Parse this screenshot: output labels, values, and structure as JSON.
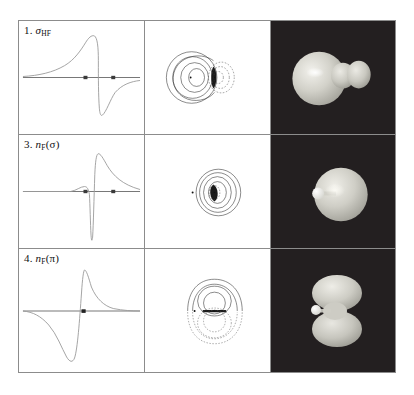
{
  "figure": {
    "caption_present": false,
    "columns": [
      "radial-profile-plot",
      "contour-plot",
      "3d-isosurface-render"
    ],
    "rows": 3,
    "background_color": "#ffffff",
    "border_color": "#8c8c8c",
    "render_background": "#231f20"
  },
  "panels": [
    {
      "index": "1.",
      "label_prefix": "1.",
      "label_main": "σ",
      "label_sub": "HF",
      "label_full": "1. σHF",
      "orbital_type": "sigma bonding",
      "plot": {
        "type": "line",
        "description": "radial amplitude profile along internuclear axis, rises to positive maximum then drops through node to deep negative minimum and recovers",
        "nuclei_markers": 2,
        "marker_positions_frac": [
          0.39,
          0.62
        ],
        "axis_zero_frac": 0.5
      },
      "contour": {
        "lobes_solid": "large nested ovals on left centered on heavy nucleus",
        "lobes_dashed": "small nested arcs on right",
        "nucleus_dots": 2
      },
      "render": {
        "shapes": "large sphere left fused with smaller sphere right",
        "atom_highlight": "bright spot at left-of-center"
      }
    },
    {
      "index": "3.",
      "label_prefix": "3.",
      "label_main": "n",
      "label_sub": "F",
      "label_paren": "(σ)",
      "label_full": "3. nF(σ)",
      "orbital_type": "fluorine sigma lone pair",
      "plot": {
        "type": "line",
        "description": "flat then small positive bump, sharp negative spike at node, then tall positive peak with long decaying tail",
        "nuclei_markers": 2,
        "marker_positions_frac": [
          0.39,
          0.62
        ],
        "axis_zero_frac": 0.5
      },
      "contour": {
        "lobes_solid": "concentric rings centered right of small nucleus",
        "lobes_dashed": "tiny inner arcs",
        "nucleus_dots": 2
      },
      "render": {
        "shapes": "single large sphere with small white atom at lower left",
        "atom_highlight": "small bright white sphere left"
      }
    },
    {
      "index": "4.",
      "label_prefix": "4.",
      "label_main": "n",
      "label_sub": "F",
      "label_paren": "(π)",
      "label_full": "4. nF(π)",
      "orbital_type": "fluorine pi lone pair",
      "plot": {
        "type": "line",
        "description": "smooth broad negative dip, crosses zero, sharp tall positive peak then decaying tail",
        "nuclei_markers": 1,
        "marker_positions_frac": [
          0.5
        ],
        "axis_zero_frac": 0.5
      },
      "contour": {
        "lobes_solid": "upper lobe nested contours",
        "lobes_dashed": "lower mirrored lobe dashed",
        "nucleus_dots": 2
      },
      "render": {
        "shapes": "two vertically stacked lobes (pi dumbbell) with small white atom at left",
        "atom_highlight": "small bright white sphere left"
      }
    }
  ]
}
